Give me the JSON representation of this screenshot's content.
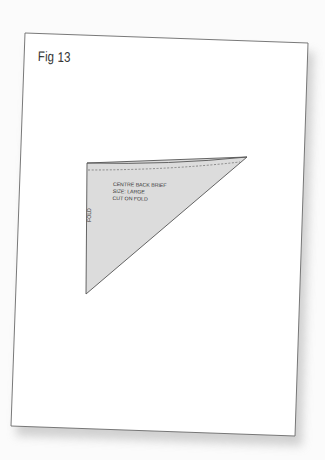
{
  "page": {
    "figure_label": "Fig 13",
    "colors": {
      "background": "#fbfbfb",
      "paper": "#ffffff",
      "paper_border": "#6a6a6a",
      "shadow": "#cfcfcf",
      "piece_fill": "#dcdcdc",
      "piece_outline": "#555555",
      "text": "#333333"
    }
  },
  "pattern_piece": {
    "name": "CENTRE BACK BRIEF",
    "size": "SIZE: LARGE",
    "instruction": "CUT ON FOLD",
    "fold_label": "FOLD",
    "shape": "right-triangle",
    "seam_allowance_line": "dashed"
  }
}
